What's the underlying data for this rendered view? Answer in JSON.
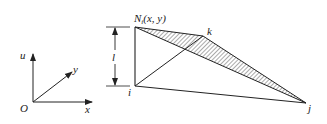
{
  "diagram": {
    "type": "finite-element triangular shape function",
    "axes": {
      "origin_label": "O",
      "x_label": "x",
      "y_label": "y",
      "u_label": "u"
    },
    "nodes": {
      "i": "i",
      "j": "j",
      "k": "k",
      "N_base": "N",
      "N_sub": "i",
      "N_args": "(x, y)"
    },
    "dimension_label": "l",
    "colors": {
      "line": "#222222",
      "hatch": "#444444",
      "background": "#ffffff"
    }
  }
}
